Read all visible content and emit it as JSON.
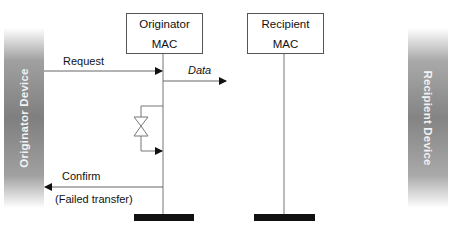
{
  "devices": {
    "originator": "Originator Device",
    "recipient": "Recipient Device"
  },
  "entities": {
    "originator_mac": {
      "line1": "Originator",
      "line2": "MAC"
    },
    "recipient_mac": {
      "line1": "Recipient",
      "line2": "MAC"
    }
  },
  "messages": {
    "request": "Request",
    "data": "Data",
    "confirm": "Confirm",
    "confirm_status": "(Failed transfer)"
  },
  "colors": {
    "line": "#555555",
    "arrow": "#111111",
    "terminator": "#111111",
    "device_bar": "#8a8a8a"
  }
}
